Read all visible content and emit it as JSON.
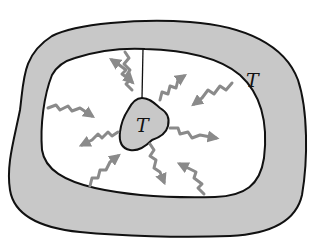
{
  "diagram": {
    "labels": {
      "wall_temperature": "T",
      "body_temperature": "T"
    },
    "colors": {
      "background": "#ffffff",
      "wall_fill": "#c8c8c8",
      "outline": "#111111",
      "arrow": "#8a8a8a",
      "cavity": "#ffffff"
    },
    "arrows": {
      "emitted_from_body_count": 6,
      "absorbed_by_body_count": 4,
      "total": 10
    }
  }
}
